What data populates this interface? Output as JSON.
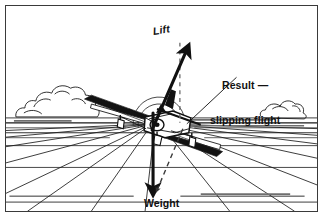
{
  "figure": {
    "kind": "aerodynamics-force-diagram",
    "background_color": "#ffffff",
    "ink_color": "#111111",
    "frame_color": "#3a3a3a",
    "width": 323,
    "height": 217
  },
  "labels": {
    "lift": "Lift",
    "result_line1": "Result —",
    "result_line2": "slipping flight",
    "weight": "Weight"
  },
  "vectors": [
    {
      "name": "lift",
      "label": "Lift",
      "style": "solid-thick-arrow",
      "color": "#111111",
      "from": [
        152,
        129
      ],
      "to": [
        187,
        49
      ],
      "description": "lift vector tilted away from vertical due to bank"
    },
    {
      "name": "vertical-reference",
      "label": "",
      "style": "dashed-thin",
      "color": "#555555",
      "from": [
        180,
        42
      ],
      "to": [
        180,
        122
      ],
      "description": "dashed vertical reference line through the lift origin"
    },
    {
      "name": "weight",
      "label": "Weight",
      "style": "solid-thick-arrow",
      "color": "#111111",
      "from": [
        152,
        113
      ],
      "to": [
        152,
        190
      ],
      "description": "weight vector acting vertically downward"
    },
    {
      "name": "result",
      "label": "Result — slipping flight",
      "style": "dashed-thin-arrow",
      "color": "#333333",
      "from": [
        182,
        128
      ],
      "to": [
        156,
        190
      ],
      "description": "resultant sideways component producing the slip"
    }
  ],
  "leaders": [
    {
      "name": "result-leader",
      "from": [
        235,
        76
      ],
      "to": [
        185,
        122
      ],
      "description": "thin leader line from the Result caption to the aircraft"
    }
  ],
  "scene": {
    "horizon_y": 118,
    "vanishing_point": [
      152,
      119
    ],
    "clouds": [
      {
        "name": "cloud-left",
        "x": 14,
        "y": 72,
        "w": 72,
        "h": 40
      },
      {
        "name": "cloud-right",
        "x": 262,
        "y": 93,
        "w": 52,
        "h": 22
      }
    ],
    "ground_bands_y": [
      128,
      141,
      163,
      198
    ],
    "radial_line_count": 14
  },
  "aircraft": {
    "name": "light-aircraft",
    "orientation": "banked left, viewed from ahead and slightly above",
    "center": [
      152,
      122
    ],
    "wingspan_px": 152,
    "features": [
      "high-wing",
      "fixed-tricycle-landing-gear",
      "vertical-stabiliser",
      "propeller-spinner"
    ]
  }
}
